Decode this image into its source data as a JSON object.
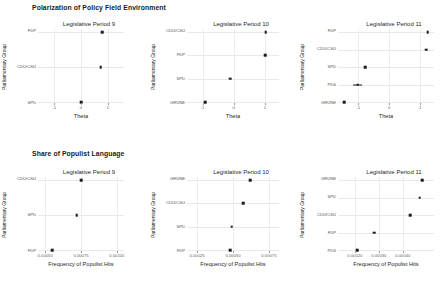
{
  "figure": {
    "sections": [
      {
        "title": "Polarization of Policy Field Environment",
        "xlabel": "Theta",
        "ylabel": "Parliamentary Group",
        "panels": [
          {
            "title": "Legislative Period 9",
            "categories": [
              "FDP",
              "CDU/CSU",
              "SPD"
            ],
            "values": [
              0.78,
              0.74,
              0.0
            ],
            "errors": [
              0,
              0,
              0
            ],
            "xlim": [
              -1.6,
              1.6
            ],
            "xticks": [
              "-1",
              "0",
              "1"
            ],
            "xtickvals": [
              -1,
              0,
              1
            ]
          },
          {
            "title": "Legislative Period 10",
            "categories": [
              "CDU/CSU",
              "FDP",
              "SPD",
              "GRÜNE"
            ],
            "values": [
              1.02,
              1.0,
              -0.12,
              -0.92
            ],
            "errors": [
              0,
              0,
              0,
              0
            ],
            "xlim": [
              -1.5,
              1.45
            ],
            "xticks": [
              "-1",
              "0",
              "1"
            ],
            "xtickvals": [
              -1,
              0,
              1
            ]
          },
          {
            "title": "Legislative Period 11",
            "categories": [
              "FDP",
              "CDU/CSU",
              "SPD",
              "PDS",
              "GRÜNE"
            ],
            "values": [
              1.25,
              1.2,
              -0.78,
              -1.02,
              -1.45
            ],
            "errors": [
              0,
              0,
              0,
              0.16,
              0
            ],
            "xlim": [
              -1.65,
              1.45
            ],
            "xticks": [
              "-1",
              "0",
              "1"
            ],
            "xtickvals": [
              -1,
              0,
              1
            ]
          }
        ]
      },
      {
        "title": "Share of Populist Language",
        "xlabel": "Frequency of Populist Hits",
        "ylabel": "Parliamentary Group",
        "panels": [
          {
            "title": "Legislative Period 9",
            "categories": [
              "CDU/CSU",
              "SPD",
              "FDP"
            ],
            "values": [
              0.00075,
              0.00072,
              0.00055
            ],
            "errors": [
              0,
              0,
              0
            ],
            "xlim": [
              0.00045,
              0.00105
            ],
            "xticks": [
              "0.00050",
              "0.00075",
              "0.00100"
            ],
            "xtickvals": [
              0.0005,
              0.00075,
              0.001
            ]
          },
          {
            "title": "Legislative Period 10",
            "categories": [
              "GRÜNE",
              "CDU/CSU",
              "SPD",
              "FDP"
            ],
            "values": [
              0.00062,
              0.00057,
              0.00049,
              0.00048
            ],
            "errors": [
              0,
              0,
              0,
              0
            ],
            "xlim": [
              0.00018,
              0.00082
            ],
            "xticks": [
              "0.00025",
              "0.00050",
              "0.00075"
            ],
            "xtickvals": [
              0.00025,
              0.0005,
              0.00075
            ]
          },
          {
            "title": "Legislative Period 11",
            "categories": [
              "GRÜNE",
              "SPD",
              "CDU/CSU",
              "FDP",
              "PDS"
            ],
            "values": [
              0.00048,
              0.00047,
              0.00043,
              0.00028,
              0.00021
            ],
            "errors": [
              0,
              0,
              0,
              0,
              0
            ],
            "xlim": [
              0.00013,
              0.00053
            ],
            "xticks": [
              "0.00020",
              "0.00030",
              "0.00040"
            ],
            "xtickvals": [
              0.0002,
              0.0003,
              0.0004
            ]
          }
        ]
      }
    ]
  },
  "chart_data": {
    "type": "scatter",
    "layout": "2 rows x 3 columns of dot plots",
    "grid": true,
    "legend": "none",
    "charts": [
      {
        "type": "scatter",
        "title": "Legislative Period 9",
        "group": "Polarization of Policy Field Environment",
        "xlabel": "Theta",
        "ylabel": "Parliamentary Group",
        "categories": [
          "FDP",
          "CDU/CSU",
          "SPD"
        ],
        "values": [
          0.78,
          0.74,
          0.0
        ],
        "xlim": [
          -1.6,
          1.6
        ],
        "xticks": [
          -1,
          0,
          1
        ]
      },
      {
        "type": "scatter",
        "title": "Legislative Period 10",
        "group": "Polarization of Policy Field Environment",
        "xlabel": "Theta",
        "ylabel": "Parliamentary Group",
        "categories": [
          "CDU/CSU",
          "FDP",
          "SPD",
          "GRÜNE"
        ],
        "values": [
          1.02,
          1.0,
          -0.12,
          -0.92
        ],
        "xlim": [
          -1.5,
          1.45
        ],
        "xticks": [
          -1,
          0,
          1
        ]
      },
      {
        "type": "scatter",
        "title": "Legislative Period 11",
        "group": "Polarization of Policy Field Environment",
        "xlabel": "Theta",
        "ylabel": "Parliamentary Group",
        "categories": [
          "FDP",
          "CDU/CSU",
          "SPD",
          "PDS",
          "GRÜNE"
        ],
        "values": [
          1.25,
          1.2,
          -0.78,
          -1.02,
          -1.45
        ],
        "errorbars": [
          0,
          0,
          0,
          0.16,
          0
        ],
        "xlim": [
          -1.65,
          1.45
        ],
        "xticks": [
          -1,
          0,
          1
        ]
      },
      {
        "type": "scatter",
        "title": "Legislative Period 9",
        "group": "Share of Populist Language",
        "xlabel": "Frequency of Populist Hits",
        "ylabel": "Parliamentary Group",
        "categories": [
          "CDU/CSU",
          "SPD",
          "FDP"
        ],
        "values": [
          0.00075,
          0.00072,
          0.00055
        ],
        "xlim": [
          0.00045,
          0.00105
        ],
        "xticks": [
          0.0005,
          0.00075,
          0.001
        ]
      },
      {
        "type": "scatter",
        "title": "Legislative Period 10",
        "group": "Share of Populist Language",
        "xlabel": "Frequency of Populist Hits",
        "ylabel": "Parliamentary Group",
        "categories": [
          "GRÜNE",
          "CDU/CSU",
          "SPD",
          "FDP"
        ],
        "values": [
          0.00062,
          0.00057,
          0.00049,
          0.00048
        ],
        "xlim": [
          0.00018,
          0.00082
        ],
        "xticks": [
          0.00025,
          0.0005,
          0.00075
        ]
      },
      {
        "type": "scatter",
        "title": "Legislative Period 11",
        "group": "Share of Populist Language",
        "xlabel": "Frequency of Populist Hits",
        "ylabel": "Parliamentary Group",
        "categories": [
          "GRÜNE",
          "SPD",
          "CDU/CSU",
          "FDP",
          "PDS"
        ],
        "values": [
          0.00048,
          0.00047,
          0.00043,
          0.00028,
          0.00021
        ],
        "xlim": [
          0.00013,
          0.00053
        ],
        "xticks": [
          0.0002,
          0.0003,
          0.0004
        ]
      }
    ]
  }
}
